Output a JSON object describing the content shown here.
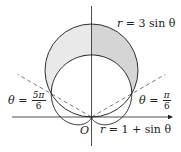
{
  "diagram": {
    "type": "polar-curves",
    "origin_label": "O",
    "curves": [
      {
        "name": "circle",
        "equation_lhs": "r",
        "equation_rhs": "= 3 sin θ",
        "label": "r = 3 sin θ"
      },
      {
        "name": "cardioid",
        "equation_lhs": "r",
        "equation_rhs": "= 1 + sin θ",
        "label": "r = 1 + sin θ"
      }
    ],
    "rays": [
      {
        "name": "theta-5pi-6",
        "theta_label": "θ",
        "eq": "=",
        "num": "5π",
        "den": "6",
        "label": "θ = 5π/6"
      },
      {
        "name": "theta-pi-6",
        "theta_label": "θ",
        "eq": "=",
        "num": "π",
        "den": "6",
        "label": "θ = π/6"
      }
    ],
    "shaded_region": "inside r = 3 sin θ and outside r = 1 + sin θ",
    "colors": {
      "shade_left": "#e9e9e9",
      "shade_right": "#d5d5d5",
      "stroke": "#1a1a1a",
      "dashed": "#555555"
    }
  }
}
